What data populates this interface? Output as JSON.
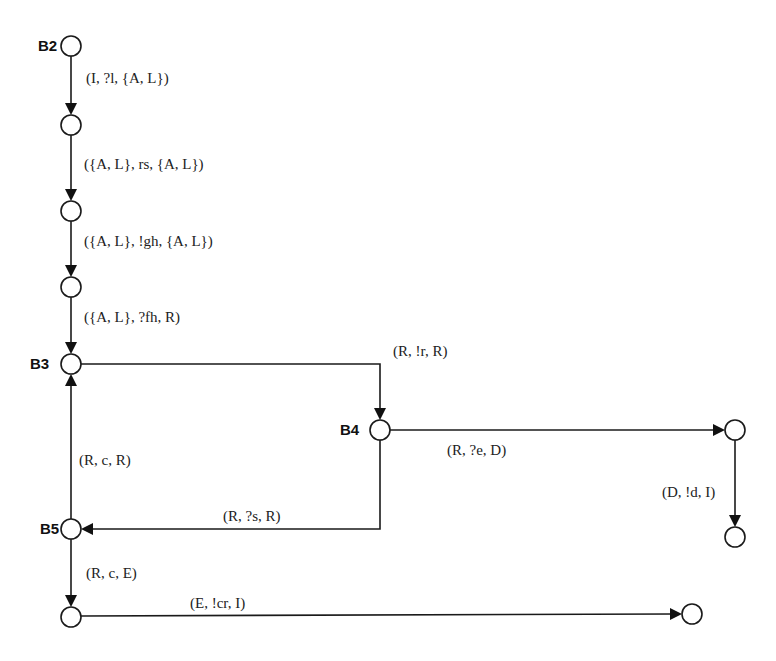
{
  "diagram": {
    "type": "state-transition-graph",
    "nodes": [
      {
        "id": "B2",
        "label": "B2",
        "x": 71,
        "y": 46
      },
      {
        "id": "n1",
        "label": "",
        "x": 71,
        "y": 125
      },
      {
        "id": "n2",
        "label": "",
        "x": 71,
        "y": 211
      },
      {
        "id": "n3",
        "label": "",
        "x": 71,
        "y": 287
      },
      {
        "id": "B3",
        "label": "B3",
        "x": 71,
        "y": 364
      },
      {
        "id": "B4",
        "label": "B4",
        "x": 380,
        "y": 430
      },
      {
        "id": "n4",
        "label": "",
        "x": 735,
        "y": 430
      },
      {
        "id": "n5",
        "label": "",
        "x": 735,
        "y": 537
      },
      {
        "id": "B5",
        "label": "B5",
        "x": 71,
        "y": 529
      },
      {
        "id": "n6",
        "label": "",
        "x": 71,
        "y": 617
      },
      {
        "id": "n7",
        "label": "",
        "x": 692,
        "y": 614
      }
    ],
    "edges": [
      {
        "from": "B2",
        "to": "n1",
        "label": "(I, ?l, {A, L})"
      },
      {
        "from": "n1",
        "to": "n2",
        "label": "({A, L}, rs, {A, L})"
      },
      {
        "from": "n2",
        "to": "n3",
        "label": "({A, L}, !gh, {A, L})"
      },
      {
        "from": "n3",
        "to": "B3",
        "label": "({A, L}, ?fh, R)"
      },
      {
        "from": "B3",
        "to": "B4",
        "label": "(R, !r, R)"
      },
      {
        "from": "B4",
        "to": "n4",
        "label": "(R, ?e, D)"
      },
      {
        "from": "n4",
        "to": "n5",
        "label": "(D, !d, I)"
      },
      {
        "from": "B4",
        "to": "B5",
        "label": "(R, ?s, R)"
      },
      {
        "from": "B5",
        "to": "B3",
        "label": "(R, c, R)"
      },
      {
        "from": "B5",
        "to": "n6",
        "label": "(R, c, E)"
      },
      {
        "from": "n6",
        "to": "n7",
        "label": "(E, !cr, I)"
      }
    ]
  },
  "labels": {
    "B2": "B2",
    "B3": "B3",
    "B4": "B4",
    "B5": "B5",
    "e_B2_n1": "(I, ?l, {A, L})",
    "e_n1_n2": "({A, L}, rs, {A, L})",
    "e_n2_n3": "({A, L}, !gh, {A, L})",
    "e_n3_B3": "({A, L}, ?fh, R)",
    "e_B3_B4": "(R, !r, R)",
    "e_B4_n4": "(R, ?e, D)",
    "e_n4_n5": "(D, !d, I)",
    "e_B4_B5": "(R, ?s, R)",
    "e_B5_B3": "(R, c, R)",
    "e_B5_n6": "(R, c, E)",
    "e_n6_n7": "(E, !cr, I)"
  },
  "colors": {
    "stroke": "#1a1a1a",
    "background": "#ffffff"
  }
}
